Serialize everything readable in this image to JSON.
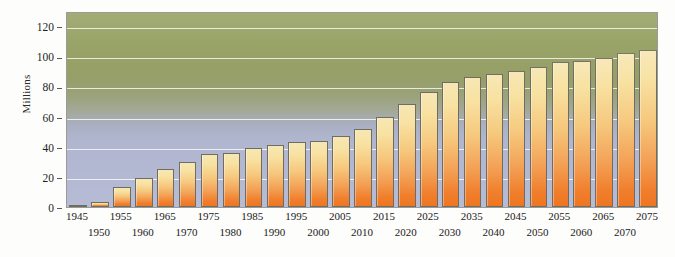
{
  "chart_data": {
    "type": "bar",
    "title": "",
    "subtitle": "",
    "xlabel": "",
    "ylabel": "Millions",
    "ylim": [
      0,
      130
    ],
    "yticks": [
      0,
      20,
      40,
      60,
      80,
      100,
      120
    ],
    "ytick_labels": [
      "0",
      "20",
      "40",
      "60",
      "80",
      "100",
      "120"
    ],
    "grid": true,
    "legend": "none",
    "categories": [
      "1945",
      "1950",
      "1955",
      "1960",
      "1965",
      "1970",
      "1975",
      "1980",
      "1985",
      "1990",
      "1995",
      "2000",
      "2005",
      "2010",
      "2015",
      "2020",
      "2025",
      "2030",
      "2035",
      "2040",
      "2045",
      "2050",
      "2055",
      "2060",
      "2065",
      "2070",
      "2075"
    ],
    "values": [
      1,
      3,
      13,
      19,
      25,
      30,
      35,
      36,
      39,
      41,
      43,
      44,
      47,
      52,
      60,
      68,
      76,
      83,
      86,
      88,
      90,
      93,
      96,
      97,
      99,
      102,
      104
    ],
    "bar_colors": {
      "top": "#f7e7b4",
      "bottom": "#ee7621",
      "outline": "#6f6d62"
    },
    "plot_background": {
      "top": "#8e9a58",
      "bottom": "#b7bcd6",
      "gridline": "#ffffff",
      "frame": "#9a9a96"
    },
    "page_background": "#fdfdfb"
  }
}
